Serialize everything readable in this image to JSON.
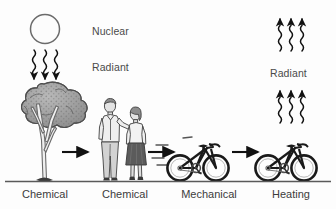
{
  "figure": {
    "type": "energy-transfer-flow-diagram",
    "background_color": "#fdfdfd",
    "ground_line_color": "#555555",
    "text_color": "#4a4a4a"
  },
  "labels": {
    "nuclear": "Nuclear",
    "radiant_left": "Radiant",
    "radiant_right": "Radiant"
  },
  "stages": [
    {
      "id": "tree",
      "label": "Chemical"
    },
    {
      "id": "people",
      "label": "Chemical"
    },
    {
      "id": "cyclist",
      "label": "Mechanical"
    },
    {
      "id": "heating",
      "label": "Heating"
    }
  ],
  "icons": {
    "sun": "sun-icon",
    "tree": "tree-icon",
    "people": "people-icon",
    "bicycle_moving": "bicycle-moving-icon",
    "bicycle_stopped": "bicycle-stopped-icon",
    "radiation_down": "radiant-arrows-down-icon",
    "radiation_up": "radiant-arrows-up-icon",
    "flow_arrow": "flow-arrow-icon"
  }
}
